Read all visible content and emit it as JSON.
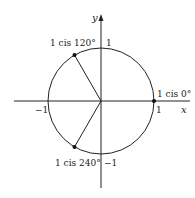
{
  "diagram": {
    "type": "unit-circle-complex-plane",
    "axes": {
      "x_label": "x",
      "y_label": "y",
      "ticks": {
        "x_pos": "1",
        "x_neg": "−1",
        "y_pos": "1",
        "y_neg": "−1"
      }
    },
    "points": [
      {
        "label": "1 cis 0°",
        "angle_deg": 0
      },
      {
        "label": "1 cis 120°",
        "angle_deg": 120
      },
      {
        "label": "1 cis 240°",
        "angle_deg": 240
      }
    ],
    "colors": {
      "stroke": "#222222",
      "background": "#ffffff"
    }
  }
}
